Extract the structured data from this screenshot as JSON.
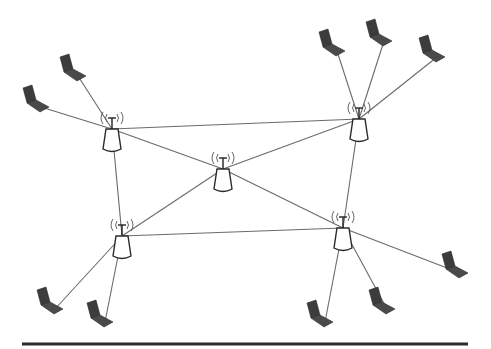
{
  "diagram": {
    "type": "wireless-mesh-network",
    "colors": {
      "background": "#ffffff",
      "link": "#6a6a6a",
      "laptop": "#3c3c3c",
      "access_point_outline": "#2a2a2a",
      "baseline": "#2b2b2b"
    },
    "access_points": [
      {
        "id": "ap1",
        "x": 112,
        "y": 118
      },
      {
        "id": "ap2",
        "x": 359,
        "y": 108
      },
      {
        "id": "ap3",
        "x": 223,
        "y": 158
      },
      {
        "id": "ap4",
        "x": 122,
        "y": 225
      },
      {
        "id": "ap5",
        "x": 343,
        "y": 217
      }
    ],
    "laptops": [
      {
        "id": "l1",
        "x": 72,
        "y": 68,
        "ap": "ap1"
      },
      {
        "id": "l2",
        "x": 35,
        "y": 99,
        "ap": "ap1"
      },
      {
        "id": "l3",
        "x": 331,
        "y": 43,
        "ap": "ap2"
      },
      {
        "id": "l4",
        "x": 378,
        "y": 33,
        "ap": "ap2"
      },
      {
        "id": "l5",
        "x": 431,
        "y": 49,
        "ap": "ap2"
      },
      {
        "id": "l6",
        "x": 49,
        "y": 301,
        "ap": "ap4"
      },
      {
        "id": "l7",
        "x": 99,
        "y": 314,
        "ap": "ap4"
      },
      {
        "id": "l8",
        "x": 319,
        "y": 314,
        "ap": "ap5"
      },
      {
        "id": "l9",
        "x": 381,
        "y": 301,
        "ap": "ap5"
      },
      {
        "id": "l10",
        "x": 454,
        "y": 265,
        "ap": "ap5"
      }
    ],
    "backbone_links": [
      [
        "ap1",
        "ap2"
      ],
      [
        "ap1",
        "ap3"
      ],
      [
        "ap1",
        "ap4"
      ],
      [
        "ap2",
        "ap3"
      ],
      [
        "ap2",
        "ap5"
      ],
      [
        "ap3",
        "ap4"
      ],
      [
        "ap3",
        "ap5"
      ],
      [
        "ap4",
        "ap5"
      ]
    ],
    "baseline": {
      "x1": 22,
      "x2": 468,
      "y": 344
    }
  }
}
